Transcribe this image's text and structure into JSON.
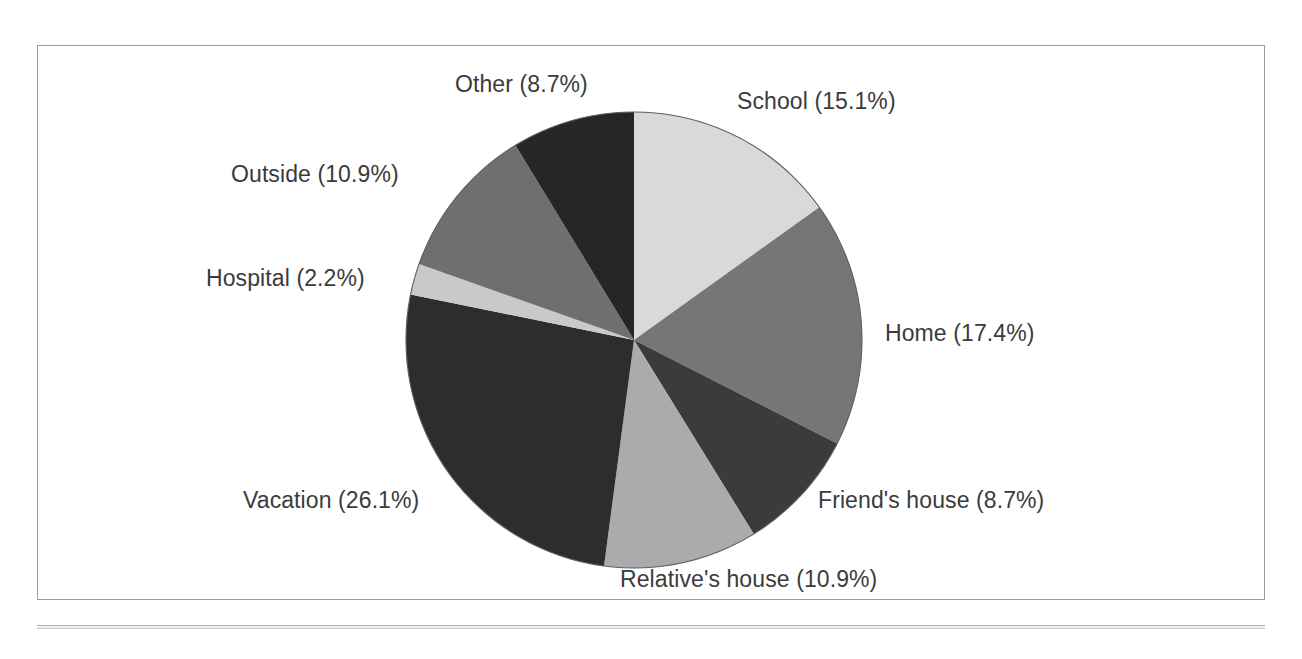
{
  "figure": {
    "background_color": "#ffffff",
    "frame_color": "#9a9a9a",
    "label_color": "#3b3b3b"
  },
  "chart_data": {
    "type": "pie",
    "title": "",
    "subtitle": "",
    "xlabel": "",
    "ylabel": "",
    "grid": false,
    "legend": "none",
    "label_format": "{name} ({value}%)",
    "start_angle_deg": 0,
    "direction": "clockwise",
    "categories": [
      "School",
      "Home",
      "Friend's house",
      "Relative's house",
      "Vacation",
      "Hospital",
      "Outside",
      "Other"
    ],
    "values": [
      15.1,
      17.4,
      8.7,
      10.9,
      26.1,
      2.2,
      10.9,
      8.7
    ],
    "total_percent": 100.0,
    "slices": [
      {
        "name": "School",
        "value": 15.1,
        "label": "School (15.1%)",
        "color": "#d9d9d9",
        "start_deg": 0.0,
        "end_deg": 54.36
      },
      {
        "name": "Home",
        "value": 17.4,
        "label": "Home (17.4%)",
        "color": "#767676",
        "start_deg": 54.36,
        "end_deg": 117.0
      },
      {
        "name": "Friend's house",
        "value": 8.7,
        "label": "Friend's house (8.7%)",
        "color": "#3b3b3b",
        "start_deg": 117.0,
        "end_deg": 148.32
      },
      {
        "name": "Relative's house",
        "value": 10.9,
        "label": "Relative's house (10.9%)",
        "color": "#ababab",
        "start_deg": 148.32,
        "end_deg": 187.56
      },
      {
        "name": "Vacation",
        "value": 26.1,
        "label": "Vacation (26.1%)",
        "color": "#2d2d2d",
        "start_deg": 187.56,
        "end_deg": 281.52
      },
      {
        "name": "Hospital",
        "value": 2.2,
        "label": "Hospital (2.2%)",
        "color": "#c9c9c9",
        "start_deg": 281.52,
        "end_deg": 289.44
      },
      {
        "name": "Outside",
        "value": 10.9,
        "label": "Outside (10.9%)",
        "color": "#6f6f6f",
        "start_deg": 289.44,
        "end_deg": 328.68
      },
      {
        "name": "Other",
        "value": 8.7,
        "label": "Other (8.7%)",
        "color": "#262626",
        "start_deg": 328.68,
        "end_deg": 360.0
      }
    ],
    "geometry": {
      "center_x": 634,
      "center_y": 340,
      "radius": 228
    }
  }
}
